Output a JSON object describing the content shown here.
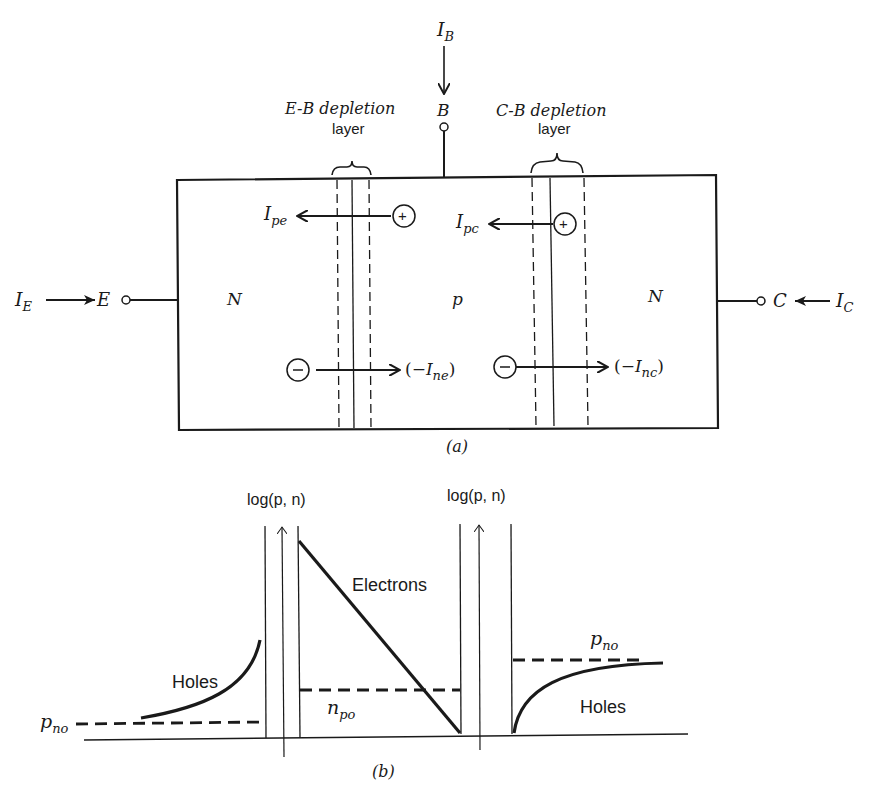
{
  "figure_a": {
    "caption": "(a)",
    "terminals": {
      "emitter": {
        "label": "E",
        "current": "I",
        "current_sub": "E"
      },
      "base": {
        "label": "B",
        "current": "I",
        "current_sub": "B"
      },
      "collector": {
        "label": "C",
        "current": "I",
        "current_sub": "C"
      }
    },
    "regions": {
      "emitter": "N",
      "base": "p",
      "collector": "N"
    },
    "depletion_layers": {
      "eb": {
        "line1": "E-B depletion",
        "line2": "layer"
      },
      "cb": {
        "line1": "C-B depletion",
        "line2": "layer"
      }
    },
    "currents": {
      "ipe": {
        "main": "I",
        "sub": "pe"
      },
      "ipc": {
        "main": "I",
        "sub": "pc"
      },
      "ine": {
        "prefix": "(−",
        "main": "I",
        "sub": "ne",
        "suffix": ")"
      },
      "inc": {
        "prefix": "(−",
        "main": "I",
        "sub": "nc",
        "suffix": ")"
      }
    },
    "carriers": {
      "plus": "+",
      "minus": "−"
    }
  },
  "figure_b": {
    "caption": "(b)",
    "axis_labels": {
      "left": "log(p, n)",
      "right": "log(p, n)"
    },
    "curve_labels": {
      "holes_left": "Holes",
      "electrons": "Electrons",
      "holes_right": "Holes"
    },
    "levels": {
      "pno_left": {
        "main": "p",
        "sub": "no"
      },
      "npo": {
        "main": "n",
        "sub": "po"
      },
      "pno_right": {
        "main": "p",
        "sub": "no"
      }
    }
  }
}
